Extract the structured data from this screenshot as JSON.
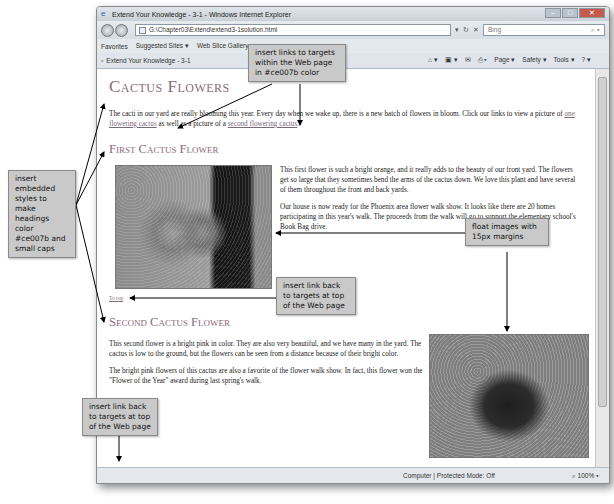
{
  "window": {
    "title": "Extend Your Knowledge - 3-1 - Windows Internet Explorer",
    "address": "G:\\Chapter03\\Extend\\extend3-1solution.html",
    "search_placeholder": "Bing",
    "favorites_label": "Favorites",
    "suggested_sites": "Suggested Sites ▾",
    "web_slice": "Web Slice Gallery ▾",
    "tab_title": "Extend Your Knowledge - 3-1",
    "commands": [
      "Page ▾",
      "Safety ▾",
      "Tools ▾"
    ],
    "status_zone": "Computer | Protected Mode: Off",
    "zoom_level": "100%"
  },
  "page": {
    "title": "Cactus Flowers",
    "intro_before": "The cacti in our yard are really blooming this year. Every day when we wake up, there is a new batch of flowers in bloom. Click our links to view a picture of ",
    "link_first": "one flowering cactus",
    "intro_middle": " as well as a picture of a ",
    "link_second": "second flowering cactus",
    "intro_after": ".",
    "first_heading": "First Cactus Flower",
    "first_p1": "This first flower is such a bright orange, and it really adds to the beauty of our front yard. The flowers get so large that they sometimes bend the arms of the cactus down. We love this plant and have several of them throughout the front and back yards.",
    "first_p2": "Our house is now ready for the Phoenix area flower walk show. It looks like there are 20 homes participating in this year's walk. The proceeds from the walk will go to support the elementary school's Book Bag drive.",
    "to_top": "To top",
    "second_heading": "Second Cactus Flower",
    "second_p1": "This second flower is a bright pink in color. They are also very beautiful, and we have many in the yard. The cactus is low to the ground, but the flowers can be seen from a distance because of their bright color.",
    "second_p2": "The bright pink flowers of this cactus are also a favorite of the flower walk show. In fact, this flower won the \"Flower of the Year\" award during last spring's walk."
  },
  "callouts": {
    "links": "insert links to targets within the Web page in #ce007b color",
    "headings": "insert embedded styles to make headings color #ce007b and small caps",
    "float": "float images with 15px margins",
    "link_back_1": "insert link back to targets at top of the Web page",
    "link_back_2": "insert link back to targets at top of the Web page"
  },
  "colors": {
    "accent": "#ce007b"
  }
}
